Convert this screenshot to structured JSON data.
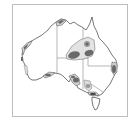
{
  "map": {
    "subject": "Australia",
    "frame_color": "#bdbdbd",
    "outline_color": "#555555",
    "border_color": "#777777",
    "zone_fill_light": "#dcdcdc",
    "zone_fill_dark": "#6a6a6a",
    "regions": [
      {
        "name": "kimberley-coast-zone"
      },
      {
        "name": "pilbara-west-coast-zone"
      },
      {
        "name": "central-east-zone"
      },
      {
        "name": "east-coast-zone"
      },
      {
        "name": "south-australia-gulf-zone"
      },
      {
        "name": "great-australian-bight-zone"
      },
      {
        "name": "victoria-south-zone"
      }
    ]
  }
}
